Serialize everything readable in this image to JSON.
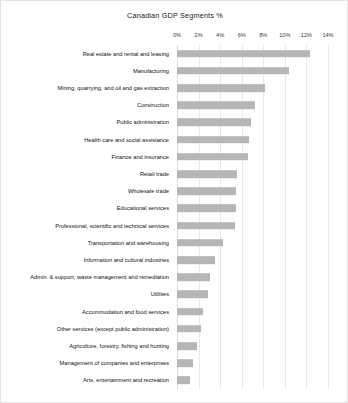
{
  "chart_data": {
    "type": "bar",
    "orientation": "horizontal",
    "title": "Canadian GDP Segments %",
    "xlabel": "",
    "ylabel": "",
    "xlim": [
      0,
      14
    ],
    "grid": true,
    "legend": "none",
    "axis_position": "top",
    "tick_labels": [
      "0%",
      "2%",
      "4%",
      "6%",
      "8%",
      "10%",
      "12%",
      "14%"
    ],
    "tick_values": [
      0,
      2,
      4,
      6,
      8,
      10,
      12,
      14
    ],
    "bar_color": "#b6b6b6",
    "categories": [
      "Real estate and rental and leasing",
      "Manufacturing",
      "Mining, quarrying, and oil and gas extraction",
      "Construction",
      "Public administration",
      "Health care and social assistance",
      "Finance and insurance",
      "Retail trade",
      "Wholesale trade",
      "Educational services",
      "Professional, scientific and technical services",
      "Transportation and warehousing",
      "Information and cultural industries",
      "Admin. & support, waste management and remediation",
      "Utilities",
      "Accommodation and food services",
      "Other services (except public administration)",
      "Agriculture, forestry, fishing and hunting",
      "Management of companies and enterprises",
      "Arts, entertainment and recreation"
    ],
    "values": [
      12.3,
      10.4,
      8.2,
      7.2,
      6.9,
      6.7,
      6.6,
      5.6,
      5.5,
      5.5,
      5.4,
      4.3,
      3.5,
      3.1,
      2.9,
      2.4,
      2.2,
      1.9,
      1.5,
      1.2
    ]
  }
}
